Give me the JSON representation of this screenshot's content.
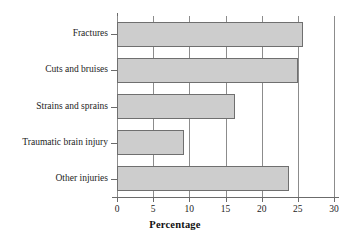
{
  "chart_data": {
    "type": "bar",
    "orientation": "horizontal",
    "title": "",
    "xlabel": "Percentage",
    "ylabel": "",
    "categories": [
      "Fractures",
      "Cuts and bruises",
      "Strains and sprains",
      "Traumatic brain injury",
      "Other injuries"
    ],
    "values": [
      25.7,
      25.0,
      16.3,
      9.3,
      23.8
    ],
    "xlim": [
      0,
      30
    ],
    "xticks": [
      0,
      5,
      10,
      15,
      20,
      25,
      30
    ],
    "xtick_labels": [
      "0",
      "5",
      "10",
      "15",
      "20",
      "25",
      "30"
    ],
    "grid": "vertical",
    "legend": "none",
    "colors": {
      "bar_fill": "#cdcdcd",
      "bar_border": "#6f6f6f",
      "grid": "#8c8c8c",
      "axis": "#6b6b6b",
      "text": "#1c1c1c",
      "background": "#ffffff"
    }
  }
}
